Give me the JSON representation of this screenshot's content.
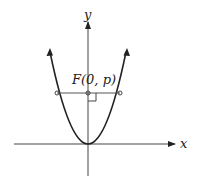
{
  "diagram": {
    "type": "parabola",
    "equation_form": "x^2 = 4py",
    "axes": {
      "x_label": "x",
      "y_label": "y"
    },
    "focus": {
      "label": "F(0, p)"
    },
    "features": [
      "vertex at origin",
      "focus on positive y-axis",
      "latus rectum through focus",
      "right angle mark at focus"
    ],
    "colors": {
      "stroke": "#222222",
      "background": "#ffffff"
    }
  }
}
